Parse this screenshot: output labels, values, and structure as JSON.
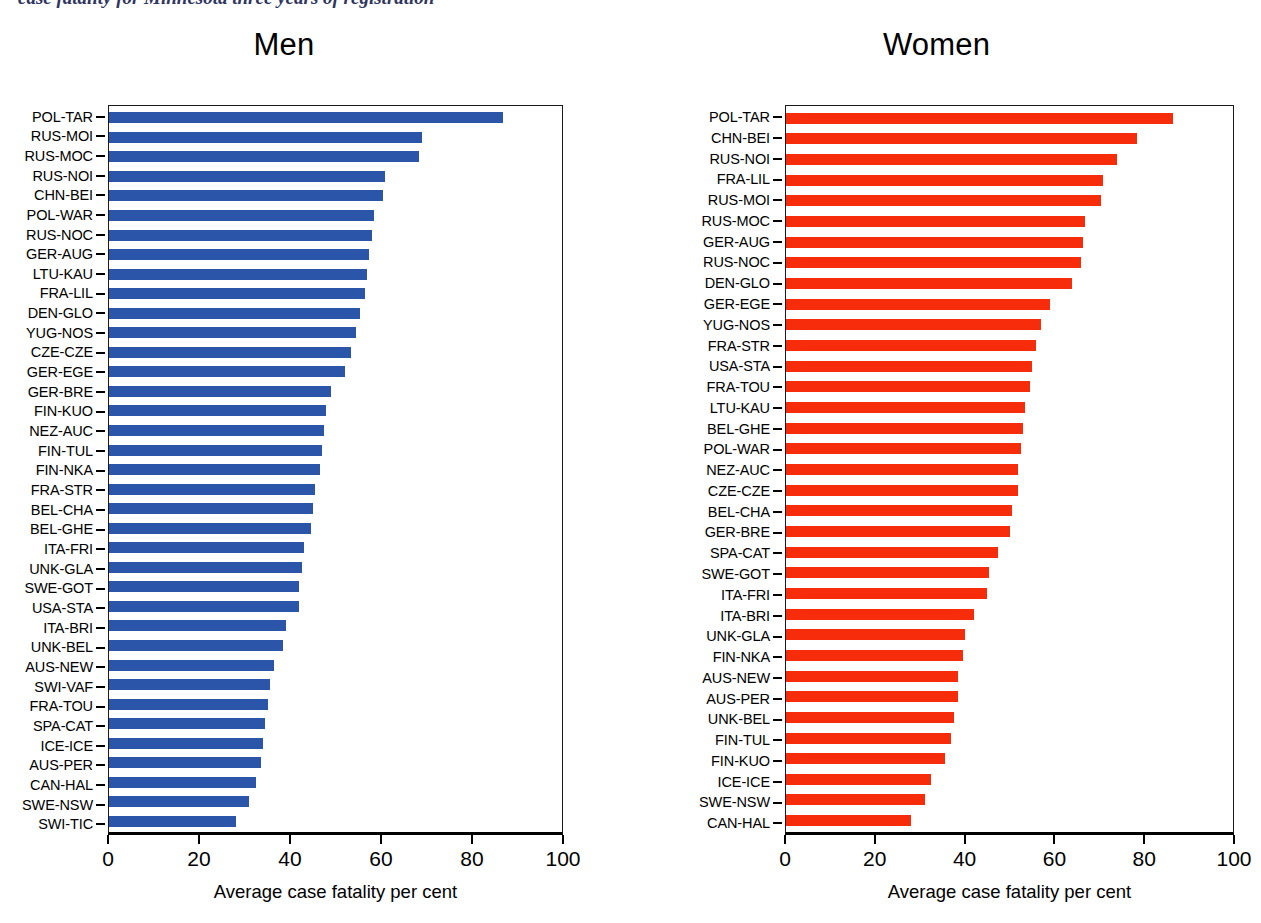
{
  "figure": {
    "clipped_running_title": "case fatality for Minnesota three years of registration"
  },
  "chart_data": [
    {
      "type": "bar",
      "orientation": "horizontal",
      "title": "Men",
      "xlabel": "Average case fatality per cent",
      "ylabel": "",
      "xlim": [
        0,
        100
      ],
      "xticks": [
        0,
        20,
        40,
        60,
        80,
        100
      ],
      "xtick_labels": [
        "0",
        "20",
        "40",
        "60",
        "80",
        "100"
      ],
      "grid": false,
      "legend": "none",
      "color": "#2b55a8",
      "categories": [
        "POL-TAR",
        "RUS-MOI",
        "RUS-MOC",
        "RUS-NOI",
        "CHN-BEI",
        "POL-WAR",
        "RUS-NOC",
        "GER-AUG",
        "LTU-KAU",
        "FRA-LIL",
        "DEN-GLO",
        "YUG-NOS",
        "CZE-CZE",
        "GER-EGE",
        "GER-BRE",
        "FIN-KUO",
        "NEZ-AUC",
        "FIN-TUL",
        "FIN-NKA",
        "FRA-STR",
        "BEL-CHA",
        "BEL-GHE",
        "ITA-FRI",
        "UNK-GLA",
        "SWE-GOT",
        "USA-STA",
        "ITA-BRI",
        "UNK-BEL",
        "AUS-NEW",
        "SWI-VAF",
        "FRA-TOU",
        "SPA-CAT",
        "ICE-ICE",
        "AUS-PER",
        "CAN-HAL",
        "SWE-NSW",
        "SWI-TIC"
      ],
      "values": [
        87,
        69,
        68.5,
        61,
        60.5,
        58.5,
        58,
        57.5,
        57,
        56.5,
        55.5,
        54.5,
        53.5,
        52,
        49,
        48,
        47.5,
        47,
        46.5,
        45.5,
        45,
        44.5,
        43,
        42.5,
        42,
        42,
        39,
        38.5,
        36.5,
        35.5,
        35,
        34.5,
        34,
        33.5,
        32.5,
        31,
        28
      ]
    },
    {
      "type": "bar",
      "orientation": "horizontal",
      "title": "Women",
      "xlabel": "Average case fatality per cent",
      "ylabel": "",
      "xlim": [
        0,
        100
      ],
      "xticks": [
        0,
        20,
        40,
        60,
        80,
        100
      ],
      "xtick_labels": [
        "0",
        "20",
        "40",
        "60",
        "80",
        "100"
      ],
      "grid": false,
      "legend": "none",
      "color": "#f72c0b",
      "categories": [
        "POL-TAR",
        "CHN-BEI",
        "RUS-NOI",
        "FRA-LIL",
        "RUS-MOI",
        "RUS-MOC",
        "GER-AUG",
        "RUS-NOC",
        "DEN-GLO",
        "GER-EGE",
        "YUG-NOS",
        "FRA-STR",
        "USA-STA",
        "FRA-TOU",
        "LTU-KAU",
        "BEL-GHE",
        "POL-WAR",
        "NEZ-AUC",
        "CZE-CZE",
        "BEL-CHA",
        "GER-BRE",
        "SPA-CAT",
        "SWE-GOT",
        "ITA-FRI",
        "ITA-BRI",
        "UNK-GLA",
        "FIN-NKA",
        "AUS-NEW",
        "AUS-PER",
        "UNK-BEL",
        "FIN-TUL",
        "FIN-KUO",
        "ICE-ICE",
        "SWE-NSW",
        "CAN-HAL"
      ],
      "values": [
        86.5,
        78.5,
        74,
        71,
        70.5,
        67,
        66.5,
        66,
        64,
        59,
        57,
        56,
        55,
        54.5,
        53.5,
        53,
        52.5,
        52,
        52,
        50.5,
        50,
        47.5,
        45.5,
        45,
        42,
        40,
        39.5,
        38.5,
        38.5,
        37.5,
        37,
        35.5,
        32.5,
        31,
        28
      ]
    }
  ]
}
